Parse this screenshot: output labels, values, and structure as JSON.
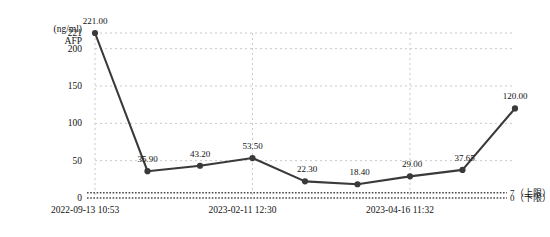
{
  "chart_data": {
    "type": "line",
    "title": "",
    "xlabel": "",
    "ylabel": "(ng/ml) AFP",
    "ylabel_unit": "(ng/ml)",
    "ylabel_name": "AFP",
    "ylim": [
      0,
      221
    ],
    "grid": true,
    "legend": "none",
    "yticks": [
      "221",
      "200",
      "150",
      "100",
      "50",
      "0"
    ],
    "ytick_values": [
      221,
      200,
      150,
      100,
      50,
      0
    ],
    "x": [
      "2022-09-13 10:53",
      "",
      "",
      "2023-02-11 12:30",
      "",
      "",
      "2023-04-16 11:32",
      "",
      ""
    ],
    "xtick_labels": [
      "2022-09-13  10:53",
      "2023-02-11   12:30",
      "2023-04-16   11:32"
    ],
    "values": [
      221.0,
      35.9,
      43.2,
      53.5,
      22.3,
      18.4,
      29.0,
      37.65,
      120.0
    ],
    "point_labels": [
      "221.00",
      "35.90",
      "43.20",
      "53.50",
      "22.30",
      "18.40",
      "29.00",
      "37.65",
      "120.00"
    ],
    "reference_lines": [
      {
        "value": 7,
        "label": "7（上限）"
      },
      {
        "value": 0,
        "label": "0（下限）"
      }
    ],
    "series_color": "#3a3a3a",
    "grid_color": "#c8c8c8"
  }
}
